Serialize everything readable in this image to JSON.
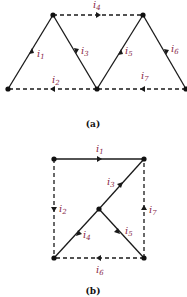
{
  "figures": [
    {
      "caption": "(a)",
      "nodes": [
        {
          "id": "A",
          "x": 53,
          "y": 15
        },
        {
          "id": "B",
          "x": 8,
          "y": 89
        },
        {
          "id": "C",
          "x": 97,
          "y": 89
        },
        {
          "id": "D",
          "x": 143,
          "y": 15
        },
        {
          "id": "E",
          "x": 186,
          "y": 89
        }
      ],
      "branches": [
        {
          "label": "i",
          "sub": "1",
          "from": "B",
          "to": "A",
          "style": "solid"
        },
        {
          "label": "i",
          "sub": "2",
          "from": "C",
          "to": "B",
          "style": "dashed"
        },
        {
          "label": "i",
          "sub": "3",
          "from": "A",
          "to": "C",
          "style": "solid"
        },
        {
          "label": "i",
          "sub": "4",
          "from": "A",
          "to": "D",
          "style": "dashed"
        },
        {
          "label": "i",
          "sub": "5",
          "from": "C",
          "to": "D",
          "style": "solid"
        },
        {
          "label": "i",
          "sub": "6",
          "from": "D",
          "to": "E",
          "style": "solid"
        },
        {
          "label": "i",
          "sub": "7",
          "from": "E",
          "to": "C",
          "style": "dashed"
        }
      ]
    },
    {
      "caption": "(b)",
      "nodes": [
        {
          "id": "TL",
          "x": 54,
          "y": 159
        },
        {
          "id": "TR",
          "x": 144,
          "y": 159
        },
        {
          "id": "M",
          "x": 99,
          "y": 209
        },
        {
          "id": "BL",
          "x": 54,
          "y": 258
        },
        {
          "id": "BR",
          "x": 144,
          "y": 258
        }
      ],
      "branches": [
        {
          "label": "i",
          "sub": "1",
          "from": "TL",
          "to": "TR",
          "style": "solid"
        },
        {
          "label": "i",
          "sub": "2",
          "from": "TL",
          "to": "BL",
          "style": "dashed"
        },
        {
          "label": "i",
          "sub": "3",
          "from": "M",
          "to": "TR",
          "style": "solid"
        },
        {
          "label": "i",
          "sub": "4",
          "from": "M",
          "to": "BL",
          "style": "solid"
        },
        {
          "label": "i",
          "sub": "5",
          "from": "BR",
          "to": "M",
          "style": "solid"
        },
        {
          "label": "i",
          "sub": "6",
          "from": "BR",
          "to": "BL",
          "style": "dashed"
        },
        {
          "label": "i",
          "sub": "7",
          "from": "BR",
          "to": "TR",
          "style": "dashed"
        }
      ]
    }
  ],
  "labels": {
    "a": {
      "i1": "i",
      "i1s": "1",
      "i2": "i",
      "i2s": "2",
      "i3": "i",
      "i3s": "3",
      "i4": "i",
      "i4s": "4",
      "i5": "i",
      "i5s": "5",
      "i6": "i",
      "i6s": "6",
      "i7": "i",
      "i7s": "7",
      "caption": "(a)"
    },
    "b": {
      "i1": "i",
      "i1s": "1",
      "i2": "i",
      "i2s": "2",
      "i3": "i",
      "i3s": "3",
      "i4": "i",
      "i4s": "4",
      "i5": "i",
      "i5s": "5",
      "i6": "i",
      "i6s": "6",
      "i7": "i",
      "i7s": "7",
      "caption": "(b)"
    }
  }
}
